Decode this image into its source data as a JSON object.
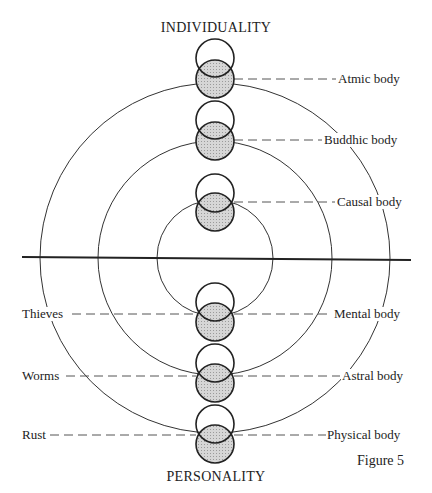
{
  "diagram": {
    "top_label": "INDIVIDUALITY",
    "bottom_label": "PERSONALITY",
    "figure_label": "Figure 5",
    "right_labels": [
      "Atmic body",
      "Buddhic body",
      "Causal body",
      "Mental body",
      "Astral body",
      "Physical body"
    ],
    "left_labels": [
      "Thieves",
      "Worms",
      "Rust"
    ],
    "colors": {
      "line": "#222222",
      "shade": "#cfcfcf",
      "background": "#ffffff"
    }
  }
}
